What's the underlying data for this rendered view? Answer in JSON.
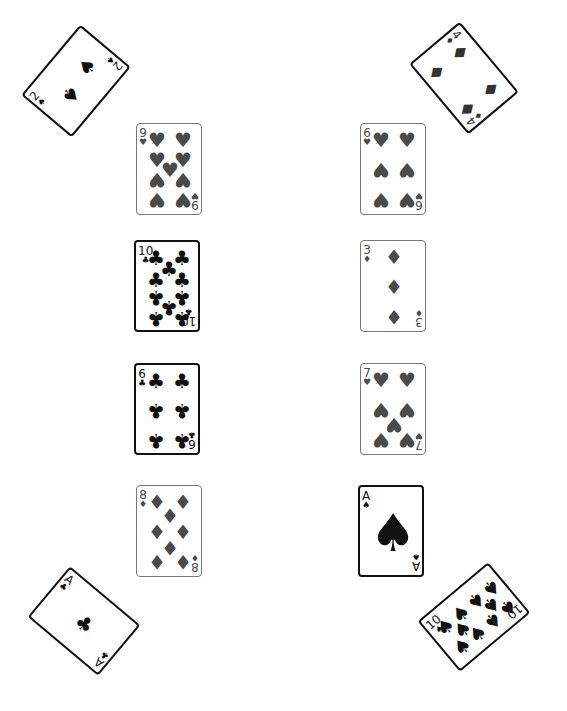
{
  "table": {
    "background": "#ffffff",
    "colors": {
      "gray_suit": "#4a4a4a",
      "black_suit": "#111111"
    }
  },
  "cards": [
    {
      "id": "2S",
      "rank": "2",
      "suit": "♠",
      "suit_name": "spades",
      "x": 30,
      "y": 48,
      "rotation": -50,
      "rotated": true,
      "dark": true,
      "color": "#111111",
      "pips": [
        [
          62,
          30,
          0
        ],
        [
          30,
          36,
          1
        ]
      ]
    },
    {
      "id": "4D",
      "rank": "4",
      "suit": "♦",
      "suit_name": "diamonds",
      "x": 418,
      "y": 45,
      "rotation": 50,
      "rotated": true,
      "dark": true,
      "color": "#333333",
      "pips": [
        [
          22,
          18,
          0
        ],
        [
          70,
          18,
          0
        ],
        [
          22,
          48,
          1
        ],
        [
          70,
          48,
          1
        ]
      ]
    },
    {
      "id": "9H",
      "rank": "9",
      "suit": "♥",
      "suit_name": "hearts",
      "x": 136,
      "y": 123,
      "rotated": false,
      "dark": false,
      "color": "#4a4a4a",
      "pips": [
        [
          20,
          16,
          0
        ],
        [
          46,
          16,
          0
        ],
        [
          20,
          36,
          0
        ],
        [
          46,
          36,
          0
        ],
        [
          33,
          46,
          0
        ],
        [
          20,
          56,
          1
        ],
        [
          46,
          56,
          1
        ],
        [
          20,
          76,
          1
        ],
        [
          46,
          76,
          1
        ]
      ]
    },
    {
      "id": "6H",
      "rank": "6",
      "suit": "♥",
      "suit_name": "hearts",
      "x": 360,
      "y": 123,
      "rotated": false,
      "dark": false,
      "color": "#4a4a4a",
      "pips": [
        [
          20,
          16,
          0
        ],
        [
          46,
          16,
          0
        ],
        [
          20,
          46,
          1
        ],
        [
          46,
          46,
          1
        ],
        [
          20,
          76,
          1
        ],
        [
          46,
          76,
          1
        ]
      ]
    },
    {
      "id": "10C",
      "rank": "10",
      "suit": "♣",
      "suit_name": "clubs",
      "x": 134,
      "y": 240,
      "rotated": false,
      "dark": true,
      "color": "#111111",
      "pips": [
        [
          20,
          16,
          0
        ],
        [
          46,
          16,
          0
        ],
        [
          33,
          27,
          0
        ],
        [
          20,
          38,
          0
        ],
        [
          46,
          38,
          0
        ],
        [
          20,
          56,
          1
        ],
        [
          46,
          56,
          1
        ],
        [
          33,
          66,
          1
        ],
        [
          20,
          77,
          1
        ],
        [
          46,
          77,
          1
        ]
      ]
    },
    {
      "id": "3D",
      "rank": "3",
      "suit": "♦",
      "suit_name": "diamonds",
      "x": 360,
      "y": 240,
      "rotated": false,
      "dark": false,
      "color": "#4a4a4a",
      "pips": [
        [
          33,
          16,
          0
        ],
        [
          33,
          46,
          0
        ],
        [
          33,
          76,
          1
        ]
      ]
    },
    {
      "id": "6C",
      "rank": "6",
      "suit": "♣",
      "suit_name": "clubs",
      "x": 134,
      "y": 363,
      "rotated": false,
      "dark": true,
      "color": "#111111",
      "pips": [
        [
          20,
          16,
          0
        ],
        [
          46,
          16,
          0
        ],
        [
          20,
          46,
          1
        ],
        [
          46,
          46,
          1
        ],
        [
          20,
          76,
          1
        ],
        [
          46,
          76,
          1
        ]
      ]
    },
    {
      "id": "7H",
      "rank": "7",
      "suit": "♥",
      "suit_name": "hearts",
      "x": 360,
      "y": 363,
      "rotated": false,
      "dark": false,
      "color": "#4a4a4a",
      "pips": [
        [
          20,
          16,
          0
        ],
        [
          46,
          16,
          0
        ],
        [
          20,
          46,
          1
        ],
        [
          46,
          46,
          1
        ],
        [
          33,
          61,
          1
        ],
        [
          20,
          76,
          1
        ],
        [
          46,
          76,
          1
        ]
      ]
    },
    {
      "id": "8D",
      "rank": "8",
      "suit": "♦",
      "suit_name": "diamonds",
      "x": 136,
      "y": 485,
      "rotated": false,
      "dark": false,
      "color": "#4a4a4a",
      "pips": [
        [
          20,
          16,
          0
        ],
        [
          46,
          16,
          0
        ],
        [
          33,
          30,
          0
        ],
        [
          20,
          46,
          0
        ],
        [
          46,
          46,
          0
        ],
        [
          33,
          62,
          1
        ],
        [
          20,
          76,
          1
        ],
        [
          46,
          76,
          1
        ]
      ]
    },
    {
      "id": "AS",
      "rank": "A",
      "suit": "♠",
      "suit_name": "spades",
      "x": 358,
      "y": 485,
      "rotated": false,
      "dark": true,
      "color": "#111111",
      "pips": [
        [
          33,
          46,
          0
        ]
      ],
      "big": true
    },
    {
      "id": "AC",
      "rank": "A",
      "suit": "♣",
      "suit_name": "clubs",
      "x": 38,
      "y": 588,
      "rotation": 40,
      "rotated": true,
      "dark": true,
      "color": "#111111",
      "pips": [
        [
          46,
          33,
          0
        ]
      ]
    },
    {
      "id": "10S",
      "rank": "10",
      "suit": "♠",
      "suit_name": "spades",
      "x": 428,
      "y": 584,
      "rotation": -40,
      "rotated": true,
      "dark": true,
      "color": "#111111",
      "pips": [
        [
          16,
          20,
          0
        ],
        [
          16,
          46,
          0
        ],
        [
          27,
          33,
          0
        ],
        [
          36,
          20,
          0
        ],
        [
          36,
          46,
          0
        ],
        [
          56,
          20,
          1
        ],
        [
          56,
          46,
          1
        ],
        [
          65,
          33,
          1
        ],
        [
          76,
          20,
          1
        ],
        [
          76,
          46,
          1
        ]
      ]
    }
  ]
}
